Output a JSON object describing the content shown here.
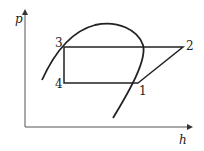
{
  "diagram": {
    "type": "p-h diagram (vapor compression refrigeration cycle)",
    "axes": {
      "y_label": "p",
      "x_label": "h"
    },
    "points": [
      {
        "id": "1",
        "label": "1"
      },
      {
        "id": "2",
        "label": "2"
      },
      {
        "id": "3",
        "label": "3"
      },
      {
        "id": "4",
        "label": "4"
      }
    ],
    "cycle_path": [
      "1",
      "2",
      "3",
      "4",
      "1"
    ],
    "colors": {
      "line": "#222222",
      "background": "#ffffff"
    }
  }
}
